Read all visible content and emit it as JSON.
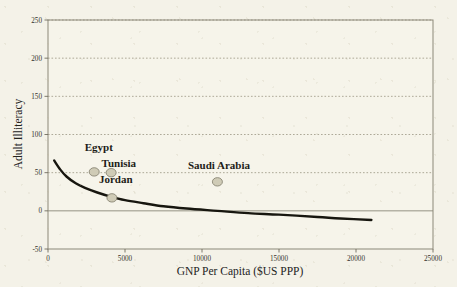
{
  "chart_data": {
    "type": "scatter",
    "title": "",
    "xlabel": "GNP Per Capita ($US PPP)",
    "ylabel": "Adult Illiteracy",
    "xlim": [
      0,
      25000
    ],
    "ylim": [
      -50,
      250
    ],
    "grid": true,
    "legend": "none",
    "xticks": [
      0,
      5000,
      10000,
      15000,
      20000,
      25000
    ],
    "xtick_labels": [
      "0",
      "5000",
      "10000",
      "15000",
      "20000",
      "25000"
    ],
    "yticks": [
      -50,
      0,
      50,
      100,
      150,
      200,
      250
    ],
    "ytick_labels": [
      "-50",
      "0",
      "50",
      "100",
      "150",
      "200",
      "250"
    ],
    "points": [
      {
        "label": "Egypt",
        "x": 3000,
        "y": 51
      },
      {
        "label": "Tunisia",
        "x": 4100,
        "y": 50
      },
      {
        "label": "Jordan",
        "x": 4150,
        "y": 17
      },
      {
        "label": "Saudi Arabia",
        "x": 11000,
        "y": 38
      }
    ],
    "point_labels": [
      {
        "text": "Egypt",
        "x": 3300,
        "y": 78
      },
      {
        "text": "Tunisia",
        "x": 4600,
        "y": 58
      },
      {
        "text": "Jordan",
        "x": 4400,
        "y": 36
      },
      {
        "text": "Saudi Arabia",
        "x": 11100,
        "y": 55
      }
    ],
    "trendline": {
      "name": "fitted-power-curve",
      "x": [
        400,
        800,
        1200,
        1800,
        2400,
        3200,
        4000,
        5000,
        6200,
        7500,
        9000,
        11000,
        13000,
        15000,
        17500,
        19000,
        21000
      ],
      "y": [
        66,
        54,
        45,
        36,
        30,
        24,
        19,
        14,
        10,
        6,
        3,
        0,
        -3,
        -5,
        -8,
        -10,
        -12
      ]
    }
  },
  "axes": {
    "x_title": "GNP Per Capita ($US PPP)",
    "y_title": "Adult Illiteracy"
  },
  "colors": {
    "background": "#f4f2e8",
    "curve": "#17160f",
    "marker_fill": "#cfcbb6",
    "marker_stroke": "#7d7a68",
    "grid": "#9a9583",
    "axis": "#8b8878",
    "text": "#1d1c18"
  }
}
